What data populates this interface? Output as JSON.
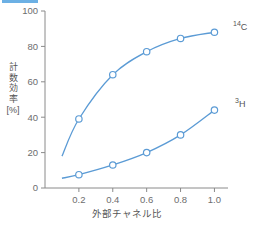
{
  "chart_data": {
    "type": "line",
    "title": "",
    "subtitle": "",
    "xlabel": "外部チャネル比",
    "ylabel": "計数効率",
    "ylabel_unit": "[%]",
    "ylabel_chars": [
      "計",
      "数",
      "効",
      "率"
    ],
    "xlim": [
      0.0,
      1.08
    ],
    "ylim": [
      0,
      100
    ],
    "xticks": [
      0.2,
      0.4,
      0.6,
      0.8,
      1.0
    ],
    "xtick_labels": [
      "0.2",
      "0.4",
      "0.6",
      "0.8",
      "1.0"
    ],
    "yticks": [
      0,
      20,
      40,
      60,
      80,
      100
    ],
    "ytick_labels": [
      "0",
      "20",
      "40",
      "60",
      "80",
      "100"
    ],
    "grid": false,
    "legend_position": "right-of-line-end",
    "marker": "open-circle",
    "series": [
      {
        "name": "14C",
        "label_base": "C",
        "label_sup": "14",
        "color": "#5b9bd5",
        "x": [
          0.2,
          0.4,
          0.6,
          0.8,
          1.0
        ],
        "values": [
          39,
          64,
          77,
          84.5,
          88
        ],
        "curve_start": {
          "x": 0.1,
          "y": 18
        }
      },
      {
        "name": "3H",
        "label_base": "H",
        "label_sup": "3",
        "color": "#5b9bd5",
        "x": [
          0.2,
          0.4,
          0.6,
          0.8,
          1.0
        ],
        "values": [
          7.5,
          13,
          20,
          30,
          44
        ],
        "curve_start": {
          "x": 0.1,
          "y": 5.5
        }
      }
    ]
  },
  "colors": {
    "accent": "#5b9bd5",
    "axis": "#8a8a8a",
    "text": "#6d6d6d",
    "header_strip": "#6cb0e4",
    "background": "#ffffff"
  }
}
